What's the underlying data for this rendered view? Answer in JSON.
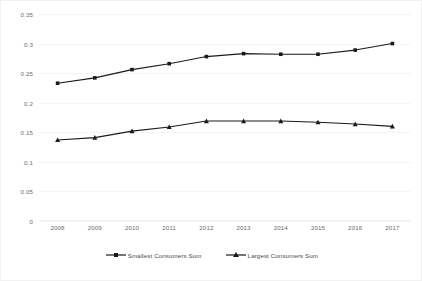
{
  "chart_data": {
    "type": "line",
    "title": "",
    "xlabel": "",
    "ylabel": "",
    "categories": [
      "2008",
      "2009",
      "2010",
      "2011",
      "2012",
      "2013",
      "2014",
      "2015",
      "2016",
      "2017"
    ],
    "ylim": [
      0,
      0.35
    ],
    "yticks": [
      "0",
      "0.05",
      "0.1",
      "0.15",
      "0.2",
      "0.25",
      "0.3",
      "0.35"
    ],
    "ytick_values": [
      0,
      0.05,
      0.1,
      0.15,
      0.2,
      0.25,
      0.3,
      0.35
    ],
    "grid": true,
    "legend_position": "bottom",
    "series": [
      {
        "name": "Smallest Consumers Sum",
        "marker": "square",
        "color": "#1a1a1a",
        "values": [
          0.233,
          0.242,
          0.256,
          0.266,
          0.278,
          0.283,
          0.282,
          0.282,
          0.289,
          0.3
        ]
      },
      {
        "name": "Largest Consumers Sum",
        "marker": "triangle",
        "color": "#1a1a1a",
        "values": [
          0.137,
          0.141,
          0.152,
          0.159,
          0.169,
          0.169,
          0.169,
          0.167,
          0.164,
          0.16
        ]
      }
    ]
  },
  "legend": {
    "items": [
      {
        "label": "Smallest Consumers Sum"
      },
      {
        "label": "Largest Consumers Sum"
      }
    ]
  }
}
